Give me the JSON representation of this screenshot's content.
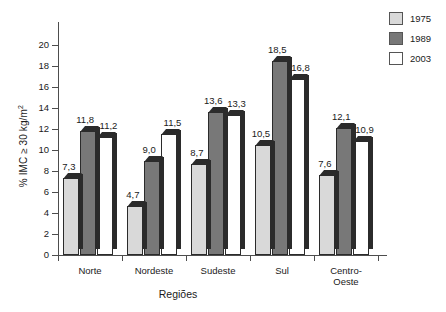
{
  "chart_data": {
    "type": "bar",
    "title": "",
    "xlabel": "Regiões",
    "ylabel": "% IMC ≥ 30 kg/m",
    "ylabel_sup": "2",
    "categories": [
      "Norte",
      "Nordeste",
      "Sudeste",
      "Sul",
      "Centro-Oeste"
    ],
    "category_lines": [
      [
        "Norte"
      ],
      [
        "Nordeste"
      ],
      [
        "Sudeste"
      ],
      [
        "Sul"
      ],
      [
        "Centro-",
        "Oeste"
      ]
    ],
    "series": [
      {
        "name": "1975",
        "color": "#d9d9d9",
        "values": [
          7.3,
          4.7,
          8.7,
          10.5,
          7.6
        ],
        "labels": [
          "7,3",
          "4,7",
          "8,7",
          "10,5",
          "7,6"
        ]
      },
      {
        "name": "1989",
        "color": "#787878",
        "values": [
          11.8,
          9.0,
          13.6,
          18.5,
          12.1
        ],
        "labels": [
          "11,8",
          "9,0",
          "13,6",
          "18,5",
          "12,1"
        ]
      },
      {
        "name": "2003",
        "color": "#ffffff",
        "values": [
          11.2,
          11.5,
          13.3,
          16.8,
          10.9
        ],
        "labels": [
          "11,2",
          "11,5",
          "13,3",
          "16,8",
          "10,9"
        ]
      }
    ],
    "ylim": [
      0,
      20
    ],
    "yticks": [
      0,
      2,
      4,
      6,
      8,
      10,
      12,
      14,
      16,
      18,
      20
    ],
    "ytick_labels": [
      "0",
      "2",
      "4",
      "6",
      "8",
      "10",
      "12",
      "14",
      "16",
      "18",
      "20"
    ],
    "grid": false,
    "legend_position": "top-right",
    "legend_entries": [
      "1975",
      "1989",
      "2003"
    ]
  }
}
